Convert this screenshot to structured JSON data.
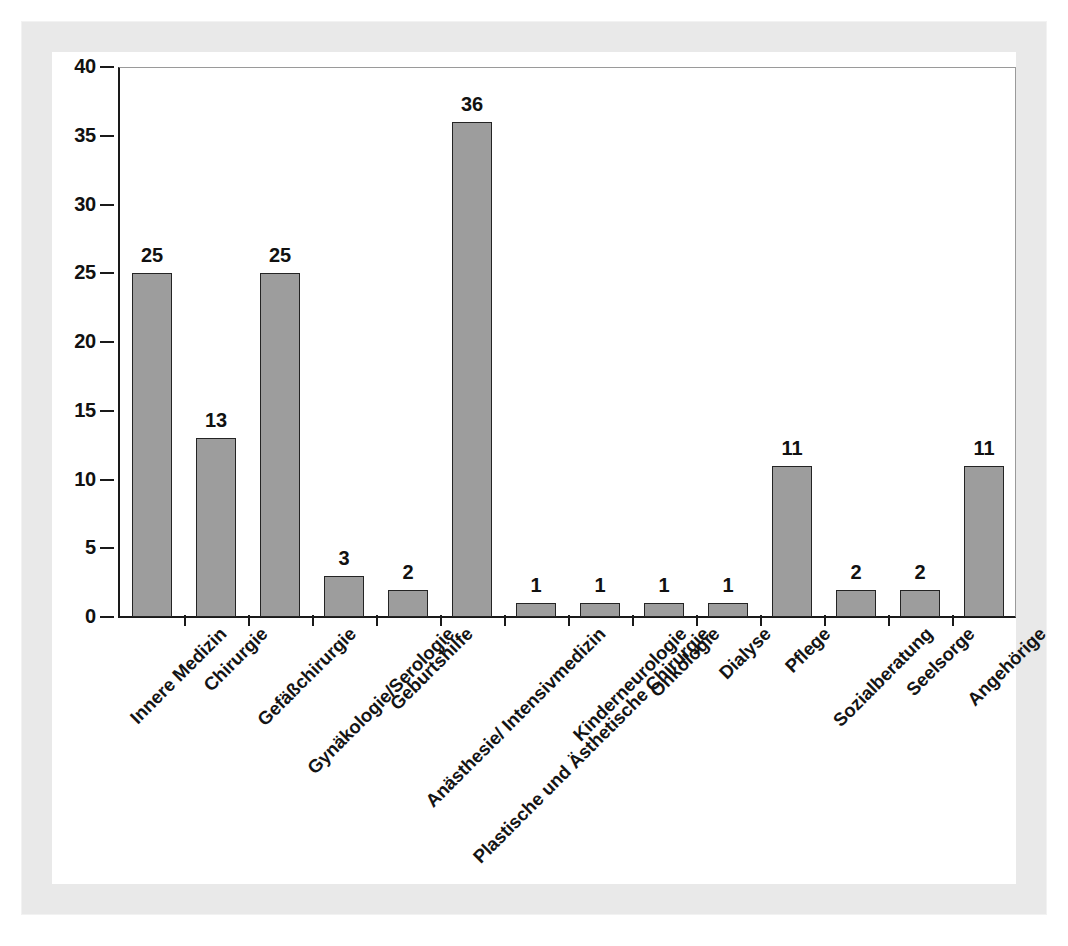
{
  "chart_data": {
    "type": "bar",
    "title": "",
    "subtitle": "",
    "xlabel": "",
    "ylabel": "",
    "ylim": [
      0,
      40
    ],
    "yticks": [
      0,
      5,
      10,
      15,
      20,
      25,
      30,
      35,
      40
    ],
    "grid": false,
    "legend": null,
    "bar_color": "#9d9d9d",
    "bar_edge_color": "#242424",
    "axis_color": "#1a1a1a",
    "value_labels_shown": true,
    "categories": [
      "Innere Medizin",
      "Chirurgie",
      "Gefäßchirurgie",
      "Gynäkologie/Serologie",
      "Geburtshilfe",
      "Anästhesie/ Intensivmedizin",
      "Plastische und Ästhetische Chirurgie",
      "Kinderneurologie",
      "Onkologie",
      "Dialyse",
      "Pflege",
      "Sozialberatung",
      "Seelsorge",
      "Angehörige"
    ],
    "values": [
      25,
      13,
      25,
      3,
      2,
      36,
      1,
      1,
      1,
      1,
      11,
      2,
      2,
      11
    ],
    "value_labels": [
      "25",
      "13",
      "25",
      "3",
      "2",
      "36",
      "1",
      "1",
      "1",
      "1",
      "11",
      "2",
      "2",
      "11"
    ],
    "ytick_labels": [
      "0",
      "5",
      "10",
      "15",
      "20",
      "25",
      "30",
      "35",
      "40"
    ]
  },
  "figure": {
    "background": "#ffffff",
    "scan_border_color": "#e9e9e9",
    "plot_border_color": "#9a9a9a"
  }
}
